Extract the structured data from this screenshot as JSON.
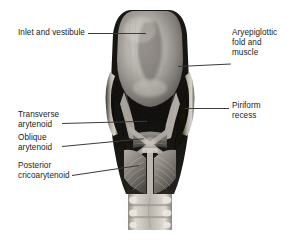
{
  "figure": {
    "kind": "anatomical-photograph",
    "background_color": "#ffffff",
    "leader_line_color": "#3c3c3c",
    "text_color": "#1b1b1b"
  },
  "labels": {
    "inlet": "Inlet and vestibule",
    "aryepiglottic": "Aryepiglottic\nfold and\nmuscle",
    "piriform": "Piriform\nrecess",
    "transverse": "Transverse\narytenoid",
    "oblique": "Oblique\narytenoid",
    "posterior": "Posterior\ncricoarytenoid"
  },
  "structures": [
    "epiglottis",
    "aryepiglottic fold",
    "piriform recess",
    "superior cornu of thyroid cartilage",
    "transverse arytenoid muscle",
    "oblique arytenoid muscle",
    "posterior cricoarytenoid muscle",
    "cricoid cartilage",
    "tracheal rings"
  ]
}
